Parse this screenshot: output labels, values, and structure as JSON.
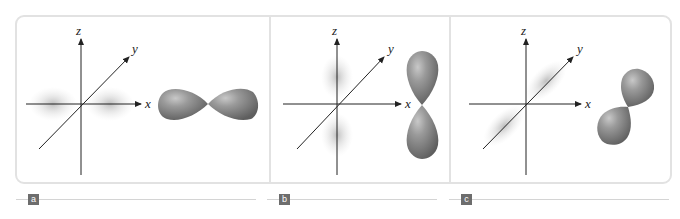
{
  "figure": {
    "panels": [
      {
        "id": "a",
        "label": "a",
        "orbital": "px",
        "axes": {
          "x": "x",
          "y": "y",
          "z": "z"
        }
      },
      {
        "id": "b",
        "label": "b",
        "orbital": "pz",
        "axes": {
          "x": "x",
          "y": "y",
          "z": "z"
        }
      },
      {
        "id": "c",
        "label": "c",
        "orbital": "py",
        "axes": {
          "x": "x",
          "y": "y",
          "z": "z"
        }
      }
    ],
    "colors": {
      "frame": "#e2e2e2",
      "badge": "#6d6d6d",
      "lobe": "#8a8a8a",
      "axis": "#222222"
    }
  }
}
